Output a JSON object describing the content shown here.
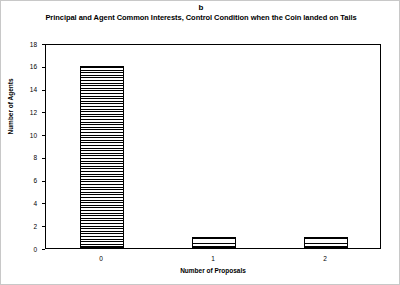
{
  "figure": {
    "panel_label": "b",
    "title": "Principal and Agent Common Interests, Control Condition when the Coin landed on Tails"
  },
  "chart_data": {
    "type": "bar",
    "title": "Principal and Agent Common Interests, Control Condition when the Coin landed on Tails",
    "panel": "b",
    "categories": [
      "0",
      "1",
      "2"
    ],
    "values": [
      16,
      1,
      1
    ],
    "xlabel": "Number of Proposals",
    "ylabel": "Number of Agents",
    "ylim": [
      0,
      18
    ],
    "ytick_step": 2,
    "yticks": [
      "18",
      "16",
      "14",
      "12",
      "10",
      "8",
      "6",
      "4",
      "2",
      "0"
    ],
    "grid": false,
    "legend": false,
    "bar_fill": "horizontal-hatch",
    "bar_edge_color": "#000000",
    "bar_face_color": "#ffffff"
  }
}
